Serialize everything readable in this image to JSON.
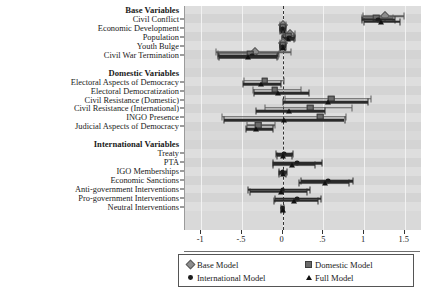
{
  "chart_data": {
    "type": "scatter",
    "title": "",
    "xlabel": "",
    "ylabel": "",
    "xlim": [
      -1.2,
      1.7
    ],
    "xticks": [
      -1,
      -0.5,
      0,
      0.5,
      1,
      1.5
    ],
    "xticklabels": [
      "-1",
      "-.5",
      "0",
      ".5",
      "1",
      "1.5"
    ],
    "grid": true,
    "zero_reference_line": 0,
    "legend_position": "bottom",
    "series": [
      {
        "name": "Base Model",
        "marker": "diamond",
        "color": "#8e8e8e"
      },
      {
        "name": "Domestic Model",
        "marker": "square",
        "color": "#6a6a6a"
      },
      {
        "name": "International Model",
        "marker": "circle",
        "color": "#1c1c1c"
      },
      {
        "name": "Full Model",
        "marker": "triangle",
        "color": "#111111"
      }
    ],
    "groups": [
      {
        "label": "Base Variables",
        "rows": [
          {
            "label": "Civil Conflict",
            "estimates": [
              {
                "series": "Base Model",
                "value": 1.26,
                "low": 0.99,
                "high": 1.49
              },
              {
                "series": "Domestic Model",
                "value": 1.15,
                "low": 0.97,
                "high": 1.36
              },
              {
                "series": "International Model",
                "value": 1.17,
                "low": 0.98,
                "high": 1.38
              },
              {
                "series": "Full Model",
                "value": 1.21,
                "low": 1.0,
                "high": 1.44
              }
            ]
          },
          {
            "label": "Economic Development",
            "estimates": [
              {
                "series": "Base Model",
                "value": 0.0,
                "low": -0.03,
                "high": 0.04
              },
              {
                "series": "Domestic Model",
                "value": 0.0,
                "low": -0.03,
                "high": 0.03
              },
              {
                "series": "International Model",
                "value": 0.0,
                "low": -0.03,
                "high": 0.04
              },
              {
                "series": "Full Model",
                "value": 0.0,
                "low": -0.03,
                "high": 0.03
              }
            ]
          },
          {
            "label": "Population",
            "estimates": [
              {
                "series": "Base Model",
                "value": 0.09,
                "low": 0.0,
                "high": 0.15
              },
              {
                "series": "Domestic Model",
                "value": 0.07,
                "low": -0.01,
                "high": 0.14
              },
              {
                "series": "International Model",
                "value": 0.08,
                "low": 0.0,
                "high": 0.15
              },
              {
                "series": "Full Model",
                "value": 0.07,
                "low": -0.01,
                "high": 0.14
              }
            ]
          },
          {
            "label": "Youth Bulge",
            "estimates": [
              {
                "series": "Base Model",
                "value": 0.0,
                "low": -0.03,
                "high": 0.04
              },
              {
                "series": "Domestic Model",
                "value": 0.0,
                "low": -0.03,
                "high": 0.03
              },
              {
                "series": "International Model",
                "value": 0.0,
                "low": -0.03,
                "high": 0.04
              },
              {
                "series": "Full Model",
                "value": 0.0,
                "low": -0.03,
                "high": 0.03
              }
            ]
          },
          {
            "label": "Civil War Termination",
            "estimates": [
              {
                "series": "Base Model",
                "value": -0.34,
                "low": -0.82,
                "high": 0.1
              },
              {
                "series": "Domestic Model",
                "value": -0.4,
                "low": -0.79,
                "high": -0.05
              },
              {
                "series": "International Model",
                "value": -0.38,
                "low": -0.8,
                "high": -0.06
              },
              {
                "series": "Full Model",
                "value": -0.42,
                "low": -0.78,
                "high": -0.07
              }
            ]
          }
        ]
      },
      {
        "label": "Domestic Variables",
        "rows": [
          {
            "label": "Electoral Aspects of Democracy",
            "estimates": [
              {
                "series": "Domestic Model",
                "value": -0.22,
                "low": -0.48,
                "high": 0.02
              },
              {
                "series": "Full Model",
                "value": -0.27,
                "low": -0.49,
                "high": -0.02
              }
            ]
          },
          {
            "label": "Electoral Democratization",
            "estimates": [
              {
                "series": "Domestic Model",
                "value": -0.1,
                "low": -0.37,
                "high": 0.23
              },
              {
                "series": "Full Model",
                "value": -0.06,
                "low": -0.35,
                "high": 0.32
              }
            ]
          },
          {
            "label": "Civil Resistance (Domestic)",
            "estimates": [
              {
                "series": "Domestic Model",
                "value": 0.6,
                "low": 0.03,
                "high": 1.08
              },
              {
                "series": "Full Model",
                "value": 0.56,
                "low": 0.01,
                "high": 1.05
              }
            ]
          },
          {
            "label": "Civil Resistance (International)",
            "estimates": [
              {
                "series": "Domestic Model",
                "value": 0.34,
                "low": -0.22,
                "high": 0.85
              },
              {
                "series": "Full Model",
                "value": 0.08,
                "low": -0.33,
                "high": 0.52
              }
            ]
          },
          {
            "label": "INGO Presence",
            "estimates": [
              {
                "series": "Domestic Model",
                "value": 0.46,
                "low": -0.75,
                "high": 0.78
              },
              {
                "series": "Full Model",
                "value": 0.02,
                "low": -0.72,
                "high": 0.76
              }
            ]
          },
          {
            "label": "Judicial Aspects of Democracy",
            "estimates": [
              {
                "series": "Domestic Model",
                "value": -0.3,
                "low": -0.44,
                "high": -0.1
              },
              {
                "series": "Full Model",
                "value": -0.33,
                "low": -0.45,
                "high": -0.12
              }
            ]
          }
        ]
      },
      {
        "label": "International Variables",
        "rows": [
          {
            "label": "Treaty",
            "estimates": [
              {
                "series": "International Model",
                "value": 0.02,
                "low": -0.08,
                "high": 0.13
              },
              {
                "series": "Full Model",
                "value": 0.01,
                "low": -0.07,
                "high": 0.12
              }
            ]
          },
          {
            "label": "PTA",
            "estimates": [
              {
                "series": "International Model",
                "value": 0.18,
                "low": -0.12,
                "high": 0.48
              },
              {
                "series": "Full Model",
                "value": 0.12,
                "low": -0.12,
                "high": 0.4
              }
            ]
          },
          {
            "label": "IGO Memberships",
            "estimates": [
              {
                "series": "International Model",
                "value": 0.0,
                "low": -0.04,
                "high": 0.05
              },
              {
                "series": "Full Model",
                "value": 0.0,
                "low": -0.04,
                "high": 0.04
              }
            ]
          },
          {
            "label": "Economic Sanctions",
            "estimates": [
              {
                "series": "International Model",
                "value": 0.56,
                "low": 0.22,
                "high": 0.86
              },
              {
                "series": "Full Model",
                "value": 0.52,
                "low": 0.2,
                "high": 0.82
              }
            ]
          },
          {
            "label": "Anti-government Interventions",
            "estimates": [
              {
                "series": "International Model",
                "value": 0.0,
                "low": -0.42,
                "high": 0.33
              },
              {
                "series": "Full Model",
                "value": -0.02,
                "low": -0.4,
                "high": 0.3
              }
            ]
          },
          {
            "label": "Pro-government Interventions",
            "estimates": [
              {
                "series": "International Model",
                "value": 0.18,
                "low": -0.1,
                "high": 0.47
              },
              {
                "series": "Full Model",
                "value": 0.14,
                "low": -0.11,
                "high": 0.44
              }
            ]
          },
          {
            "label": "Neutral Interventions",
            "estimates": [
              {
                "series": "International Model",
                "value": 0.0,
                "low": -0.02,
                "high": 0.02
              },
              {
                "series": "Full Model",
                "value": 0.0,
                "low": -0.02,
                "high": 0.02
              }
            ]
          }
        ]
      }
    ]
  },
  "legend": {
    "items": [
      {
        "label": "Base Model",
        "marker": "diamond"
      },
      {
        "label": "Domestic Model",
        "marker": "square"
      },
      {
        "label": "International Model",
        "marker": "circle"
      },
      {
        "label": "Full Model",
        "marker": "triangle"
      }
    ]
  }
}
